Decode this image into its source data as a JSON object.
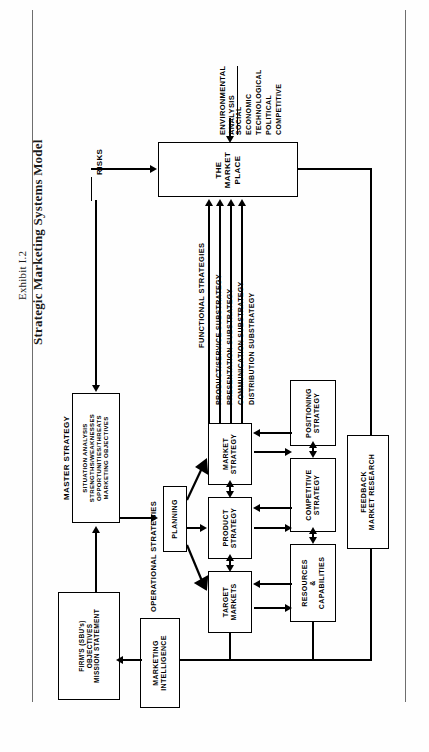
{
  "page": {
    "width": 429,
    "height": 752,
    "background": "#fefefe",
    "ink": "#000000"
  },
  "caption": {
    "exhibit": "Exhibit I.2",
    "title": "Strategic Marketing Systems Model"
  },
  "diagram": {
    "orientation": "rotated-90-counterclockwise",
    "section_labels": {
      "master_strategy": "MASTER STRATEGY",
      "operational_strategies": "OPERATIONAL STRATEGIES",
      "functional_strategies": "FUNCTIONAL STRATEGIES",
      "environmental_analysis_heading": "ENVIRONMENTAL\nANALYSIS",
      "risks": "RISKS"
    },
    "environment_factors": [
      "SOCIAL",
      "ECONOMIC",
      "TECHNOLOGICAL",
      "POLITICAL",
      "COMPETITIVE"
    ],
    "functional_substrategies": [
      "PRODUCT/SERVICE SUBSTRATEGY",
      "PRESENTATION SUBSTRATEGY",
      "COMMUNICATION SUBSTRATEGY",
      "DISTRIBUTION SUBSTRATEGY"
    ],
    "nodes": {
      "marketplace": {
        "lines": [
          "THE",
          "MARKET",
          "PLACE"
        ],
        "text": "THE MARKET PLACE"
      },
      "firm_objectives": {
        "lines": [
          "FIRM'S (SBU's)",
          "OBJECTIVES",
          "MISSION STATEMENT"
        ],
        "text": "FIRM'S (SBU's) OBJECTIVES MISSION STATEMENT"
      },
      "master_strategy_box": {
        "lines": [
          "SITUATION ANALYSIS",
          "STRENGTHS/WEAKNESSES",
          "OPPORTUNITIES/THREATS",
          "MARKETING OBJECTIVES"
        ],
        "text": "SITUATION ANALYSIS STRENGTHS/WEAKNESSES OPPORTUNITIES/THREATS MARKETING OBJECTIVES"
      },
      "planning": {
        "lines": [
          "PLANNING"
        ],
        "text": "PLANNING"
      },
      "market_strategy": {
        "lines": [
          "MARKET",
          "STRATEGY"
        ],
        "text": "MARKET STRATEGY"
      },
      "product_strategy": {
        "lines": [
          "PRODUCT",
          "STRATEGY"
        ],
        "text": "PRODUCT STRATEGY"
      },
      "target_markets": {
        "lines": [
          "TARGET",
          "MARKETS"
        ],
        "text": "TARGET MARKETS"
      },
      "positioning_strategy": {
        "lines": [
          "POSITIONING",
          "STRATEGY"
        ],
        "text": "POSITIONING STRATEGY"
      },
      "competitive_strategy": {
        "lines": [
          "COMPETITIVE",
          "STRATEGY"
        ],
        "text": "COMPETITIVE STRATEGY"
      },
      "resources_capabilities": {
        "lines": [
          "RESOURCES",
          "&",
          "CAPABILITIES"
        ],
        "text": "RESOURCES & CAPABILITIES"
      },
      "marketing_intelligence": {
        "lines": [
          "MARKETING",
          "INTELLIGENCE"
        ],
        "text": "MARKETING INTELLIGENCE"
      },
      "feedback_market_research": {
        "lines": [
          "FEEDBACK",
          "MARKET RESEARCH"
        ],
        "text": "FEEDBACK MARKET RESEARCH"
      }
    }
  }
}
